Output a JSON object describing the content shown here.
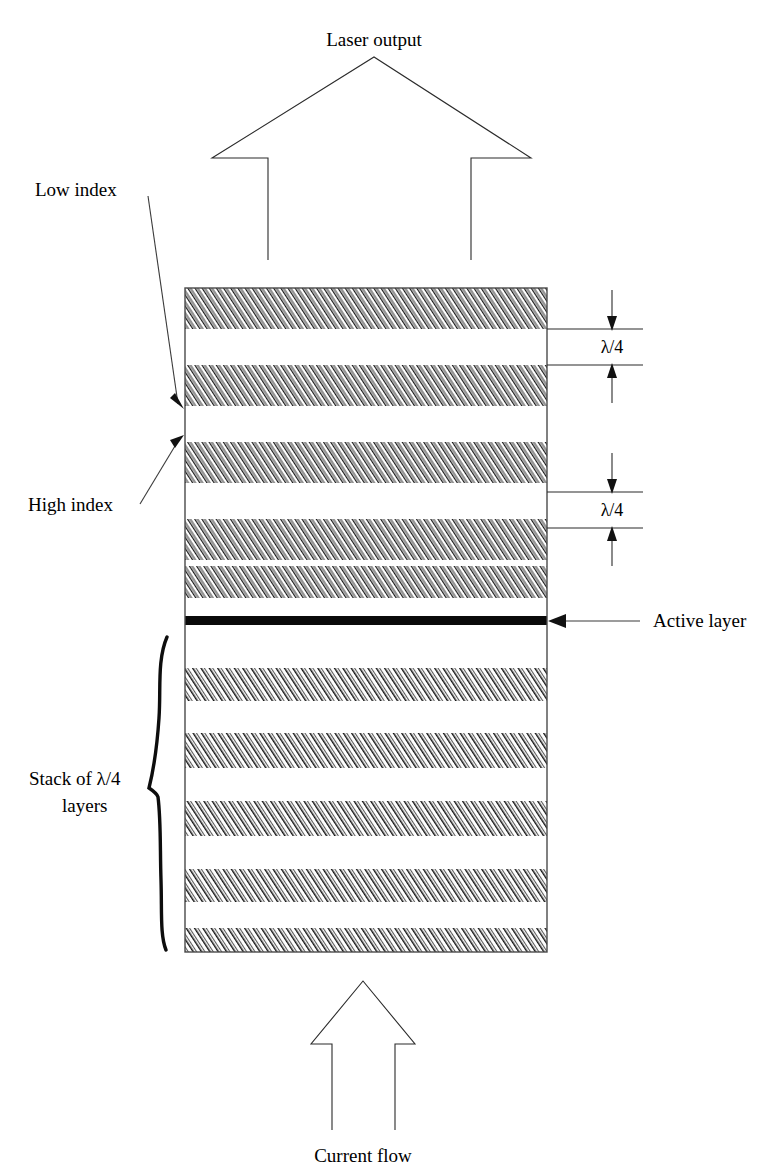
{
  "figure": {
    "type": "vcsel-dbr-cross-section-diagram",
    "title_text": "Laser output",
    "bottom_text": "Current flow"
  },
  "labels": {
    "laser_output": "Laser output",
    "current_flow": "Current flow",
    "low_index": "Low index",
    "high_index": "High index",
    "active_layer": "Active layer",
    "stack_line1": "Stack of λ/4",
    "stack_line2": "layers",
    "lambda_quarter_top": "λ/4",
    "lambda_quarter_bottom": "λ/4"
  },
  "dimensions": {
    "lambda_symbol": "λ",
    "fraction": "/4",
    "annotation_count": 2,
    "annotated_top_layer": "low-index-white-layer",
    "annotated_bottom_layer": "high-index-hatched-layer"
  },
  "structure": {
    "stack_left_x": 185,
    "stack_right_x": 547,
    "stack_top_y": 288,
    "stack_bottom_y": 952,
    "upper_mirror_pairs": 5,
    "lower_mirror_pairs": 5,
    "active_layer_y": 620,
    "active_layer_thickness": 9,
    "layer_order_top_to_bottom": [
      "high",
      "low",
      "high",
      "low",
      "high",
      "low",
      "high",
      "low",
      "high",
      "low",
      "active",
      "low",
      "high",
      "low",
      "high",
      "low",
      "high",
      "low",
      "high",
      "low",
      "high"
    ]
  },
  "colors": {
    "hatch_ink": "#1a1a1a",
    "hatch_background": "#ffffff",
    "outline": "#4a4a4a",
    "active_layer": "#0a0a0a",
    "text": "#000000",
    "leader_line": "#3a3a3a"
  }
}
